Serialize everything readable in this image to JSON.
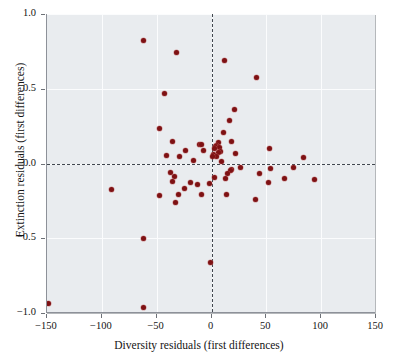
{
  "chart_data": {
    "type": "scatter",
    "title": "",
    "xlabel": "Diversity residuals (first differences)",
    "ylabel": "Extinction residuals (first differences)",
    "xlim": [
      -150,
      150
    ],
    "ylim": [
      -1.0,
      1.0
    ],
    "xticks": [
      -150,
      -100,
      -50,
      0,
      50,
      100,
      150
    ],
    "xticklabels": [
      "−150",
      "−100",
      "−50",
      "0",
      "50",
      "100",
      "150"
    ],
    "yticks": [
      -1.0,
      -0.5,
      0.0,
      0.5,
      1.0
    ],
    "yticklabels": [
      "−1.0",
      "−0.5",
      "0.0",
      "0.5",
      "1.0"
    ],
    "grid": true,
    "legend": null,
    "reference_lines": [
      {
        "axis": "x",
        "value": 0,
        "style": "dashed"
      },
      {
        "axis": "y",
        "value": 0,
        "style": "dashed"
      }
    ],
    "marker_color": "#7e1113",
    "plot_background": "#e9ecef",
    "series": [
      {
        "name": "Diversity vs extinction residuals",
        "points": [
          [
            -62,
            0.825
          ],
          [
            -32,
            0.74
          ],
          [
            12,
            0.69
          ],
          [
            41,
            0.575
          ],
          [
            -43,
            0.47
          ],
          [
            21,
            0.36
          ],
          [
            16,
            0.285
          ],
          [
            -47,
            0.235
          ],
          [
            11,
            0.205
          ],
          [
            -36,
            0.15
          ],
          [
            18,
            0.15
          ],
          [
            6,
            0.14
          ],
          [
            -11,
            0.13
          ],
          [
            -9,
            0.125
          ],
          [
            5,
            0.12
          ],
          [
            4,
            0.112
          ],
          [
            7,
            0.108
          ],
          [
            3,
            0.1
          ],
          [
            53,
            0.1
          ],
          [
            -24,
            0.09
          ],
          [
            -7,
            0.085
          ],
          [
            8,
            0.082
          ],
          [
            6,
            0.072
          ],
          [
            22,
            0.068
          ],
          [
            2,
            0.062
          ],
          [
            -41,
            0.055
          ],
          [
            5,
            0.05
          ],
          [
            1,
            0.048
          ],
          [
            -29,
            0.045
          ],
          [
            84,
            0.04
          ],
          [
            -16,
            0.018
          ],
          [
            9,
            0.012
          ],
          [
            26,
            -0.025
          ],
          [
            75,
            -0.025
          ],
          [
            54,
            -0.032
          ],
          [
            18,
            -0.04
          ],
          [
            17,
            -0.048
          ],
          [
            -37,
            -0.062
          ],
          [
            15,
            -0.065
          ],
          [
            44,
            -0.068
          ],
          [
            -34,
            -0.085
          ],
          [
            3,
            -0.092
          ],
          [
            13,
            -0.098
          ],
          [
            67,
            -0.102
          ],
          [
            94,
            -0.105
          ],
          [
            -36,
            -0.118
          ],
          [
            52,
            -0.125
          ],
          [
            -19,
            -0.128
          ],
          [
            -2,
            -0.132
          ],
          [
            -13,
            -0.14
          ],
          [
            -25,
            -0.165
          ],
          [
            -91,
            -0.175
          ],
          [
            -30,
            -0.205
          ],
          [
            -9,
            -0.205
          ],
          [
            14,
            -0.208
          ],
          [
            -47,
            -0.215
          ],
          [
            40,
            -0.24
          ],
          [
            -33,
            -0.26
          ],
          [
            -62,
            -0.5
          ],
          [
            -1,
            -0.665
          ],
          [
            -149,
            -0.935
          ],
          [
            -62,
            -0.965
          ]
        ]
      }
    ]
  }
}
